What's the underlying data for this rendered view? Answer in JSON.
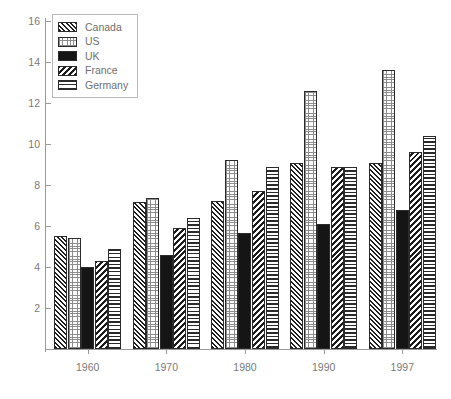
{
  "chart_data": {
    "type": "bar",
    "title": "",
    "subtitle": "",
    "xlabel": "",
    "ylabel": "",
    "categories": [
      "1960",
      "1970",
      "1980",
      "1990",
      "1997"
    ],
    "series": [
      {
        "name": "Canada",
        "pattern": "diagonal-hatch-right-dense",
        "values": [
          5.5,
          7.15,
          7.2,
          9.05,
          9.05
        ]
      },
      {
        "name": "US",
        "pattern": "dotted-light",
        "values": [
          5.4,
          7.35,
          9.2,
          12.6,
          13.6
        ]
      },
      {
        "name": "UK",
        "pattern": "solid-black",
        "values": [
          4.0,
          4.6,
          5.65,
          6.1,
          6.8
        ]
      },
      {
        "name": "France",
        "pattern": "diagonal-hatch-left-coarse",
        "values": [
          4.3,
          5.9,
          7.7,
          8.9,
          9.6
        ]
      },
      {
        "name": "Germany",
        "pattern": "horizontal-lines",
        "values": [
          4.9,
          6.4,
          8.9,
          8.9,
          10.4
        ]
      }
    ],
    "ylim": [
      0,
      16
    ],
    "yticks": [
      2,
      4,
      6,
      8,
      10,
      12,
      14,
      16
    ],
    "ytick_labels": [
      "2",
      "4",
      "6",
      "8",
      "10",
      "12",
      "14",
      "16"
    ],
    "grid": false,
    "legend_position": "top-left",
    "legend_entries": [
      "Canada",
      "US",
      "UK",
      "France",
      "Germany"
    ]
  },
  "axes": {
    "y": {
      "ticks": [
        "16",
        "14",
        "12",
        "10",
        "8",
        "6",
        "4",
        "2"
      ]
    },
    "x": {
      "ticks": [
        "1960",
        "1970",
        "1980",
        "1990",
        "1997"
      ]
    }
  }
}
